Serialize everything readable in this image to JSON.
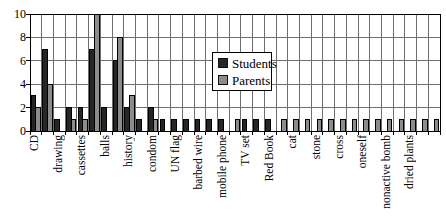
{
  "chart_data": {
    "type": "bar",
    "title": "",
    "xlabel": "",
    "ylabel": "",
    "ylim": [
      0,
      10
    ],
    "yticks": [
      0,
      2,
      4,
      6,
      8,
      10
    ],
    "grid": "both",
    "legend_position": "inside-top-center",
    "categories": [
      "CD",
      "",
      "drawing",
      "",
      "cassettes",
      "",
      "balls",
      "",
      "history",
      "",
      "condom",
      "",
      "UN flag",
      "",
      "barbed wire",
      "",
      "mobile phone",
      "",
      "TV set",
      "",
      "Red Book",
      "",
      "cat",
      "",
      "stone",
      "",
      "cross",
      "",
      "oneself",
      "",
      "nonactive bomb",
      "",
      "dried plants",
      "",
      ""
    ],
    "series": [
      {
        "name": "Students",
        "color": "#262626",
        "values": [
          3,
          7,
          1,
          2,
          2,
          7,
          2,
          6,
          2,
          1,
          2,
          1,
          1,
          1,
          1,
          1,
          1,
          0,
          1,
          1,
          1,
          0,
          0,
          0,
          0,
          0,
          0,
          0,
          0,
          0,
          0,
          0,
          0,
          0,
          0
        ]
      },
      {
        "name": "Parents",
        "color": "#8c8c8c",
        "values": [
          2,
          4,
          0,
          1,
          1,
          10,
          0,
          8,
          3,
          0,
          1,
          0,
          0,
          0,
          0,
          0,
          0,
          1,
          0,
          0,
          0,
          1,
          1,
          1,
          1,
          1,
          1,
          1,
          1,
          1,
          1,
          1,
          1,
          1,
          1
        ]
      }
    ],
    "colors": {
      "axis": "#000000",
      "gridline": "#6e6e6e",
      "bar_outline": "#000000",
      "plot_background": "#ffffff"
    }
  }
}
